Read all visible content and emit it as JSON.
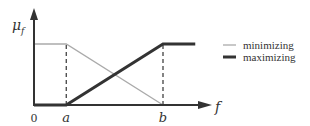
{
  "chart_data": {
    "type": "line",
    "title": "",
    "xlabel": "f",
    "ylabel": "μ_f",
    "xlim": [
      0,
      1.33
    ],
    "ylim": [
      0,
      1.2
    ],
    "x_ticks": [
      {
        "value": 0,
        "label": "0"
      },
      {
        "value": 0.25,
        "label": "a"
      },
      {
        "value": 1.0,
        "label": "b"
      }
    ],
    "grid": false,
    "legend_position": "right",
    "series": [
      {
        "name": "minimizing",
        "style": "thin",
        "color": "#aaaaaa",
        "points": [
          [
            0,
            1
          ],
          [
            0.25,
            1
          ],
          [
            1.0,
            0
          ]
        ]
      },
      {
        "name": "maximizing",
        "style": "thick",
        "color": "#333333",
        "points": [
          [
            0,
            0
          ],
          [
            0.25,
            0
          ],
          [
            1.0,
            1
          ],
          [
            1.25,
            1
          ]
        ]
      }
    ],
    "guides": [
      {
        "x": 0.25,
        "from": 0,
        "to": 1,
        "style": "dashed"
      },
      {
        "x": 1.0,
        "from": 0,
        "to": 1,
        "style": "dashed"
      }
    ]
  },
  "labels": {
    "y_axis": "μ",
    "y_axis_sub": "f",
    "x_axis": "f"
  }
}
